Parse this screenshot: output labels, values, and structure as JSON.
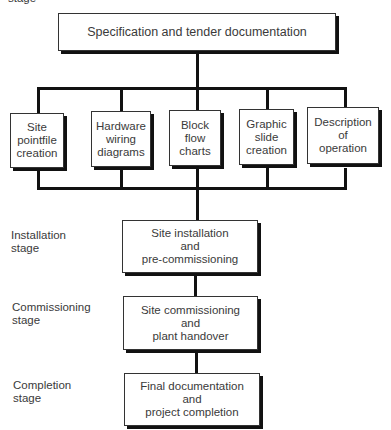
{
  "stage_labels": {
    "top_partial": "stage",
    "installation": [
      "Installation",
      "stage"
    ],
    "commissioning": [
      "Commissioning",
      "stage"
    ],
    "completion": [
      "Completion",
      "stage"
    ]
  },
  "top_box": "Specification and tender documentation",
  "parallel_boxes": [
    [
      "Site",
      "pointfile",
      "creation"
    ],
    [
      "Hardware",
      "wiring",
      "diagrams"
    ],
    [
      "Block",
      "flow",
      "charts"
    ],
    [
      "Graphic",
      "slide",
      "creation"
    ],
    [
      "Description",
      "of",
      "operation"
    ]
  ],
  "sequence_boxes": [
    [
      "Site installation",
      "and",
      "pre-commissioning"
    ],
    [
      "Site commissioning",
      "and",
      "plant handover"
    ],
    [
      "Final documentation",
      "and",
      "project completion"
    ]
  ]
}
